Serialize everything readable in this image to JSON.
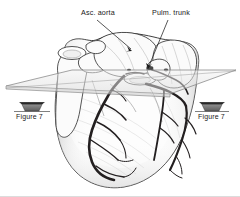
{
  "figure": {
    "type": "anatomical-illustration",
    "background_color": "#ffffff",
    "ink_color": "#1a1a1a",
    "vessel_color": "#231f20",
    "plane_fill": "#e9e9e9",
    "plane_stroke": "#8a8a8a",
    "shading_color": "#c9c9c9"
  },
  "labels": {
    "asc_aorta": "Asc. aorta",
    "pulm_trunk": "Pulm. trunk",
    "figure7_left": "Figure 7",
    "figure7_right": "Figure 7"
  },
  "leader_lines": [
    {
      "name": "asc-aorta-leader",
      "from_x": 97,
      "from_y": 19,
      "to_x": 132,
      "to_y": 51,
      "arrow": "filled-triangle"
    },
    {
      "name": "pulm-trunk-leader",
      "from_x": 168,
      "from_y": 19,
      "to_x": 147,
      "to_y": 69,
      "arrow": "filled-triangle"
    }
  ],
  "view_arrows": [
    {
      "name": "figure7-left-arrow",
      "cx": 32,
      "cy": 105,
      "direction": "toward-viewer",
      "label": "Figure 7"
    },
    {
      "name": "figure7-right-arrow",
      "cx": 212,
      "cy": 105,
      "direction": "toward-viewer",
      "label": "Figure 7"
    }
  ],
  "section_plane": {
    "name": "transverse-section-plane",
    "points": "6,86 72,70 236,70 170,94",
    "description": "parallelogram cutting plane through the great vessels"
  }
}
